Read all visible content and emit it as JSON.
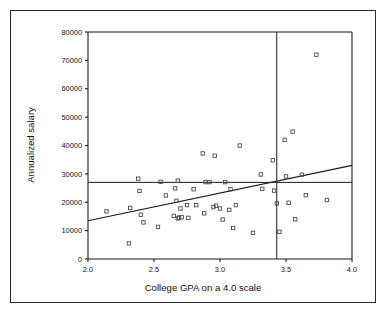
{
  "figure": {
    "border_color": "#2b2b2b",
    "background": "#ffffff",
    "ink_color": "#1a1a1a",
    "marker_color": "#4a4a4a"
  },
  "labels": {
    "x_axis_title": "College GPA on a 4.0 scale",
    "y_axis_title": "Annualized salary",
    "x_ticks": [
      "2.0",
      "2.5",
      "3.0",
      "3.5",
      "4.0"
    ],
    "y_ticks": [
      "0",
      "10000",
      "20000",
      "30000",
      "40000",
      "50000",
      "60000",
      "70000",
      "80000"
    ]
  },
  "chart_data": {
    "type": "scatter",
    "title": "",
    "xlabel": "College GPA on a 4.0 scale",
    "ylabel": "Annualized salary",
    "xlim": [
      2.0,
      4.0
    ],
    "ylim": [
      0,
      80000
    ],
    "xticks": [
      2.0,
      2.5,
      3.0,
      3.5,
      4.0
    ],
    "yticks": [
      0,
      10000,
      20000,
      30000,
      40000,
      50000,
      60000,
      70000,
      80000
    ],
    "grid": false,
    "legend": "none",
    "marker": "open-square",
    "points": [
      [
        2.14,
        16800
      ],
      [
        2.31,
        5500
      ],
      [
        2.32,
        18000
      ],
      [
        2.38,
        28300
      ],
      [
        2.39,
        24000
      ],
      [
        2.4,
        15600
      ],
      [
        2.42,
        12900
      ],
      [
        2.53,
        11300
      ],
      [
        2.55,
        27200
      ],
      [
        2.59,
        22400
      ],
      [
        2.65,
        15200
      ],
      [
        2.66,
        24900
      ],
      [
        2.67,
        20500
      ],
      [
        2.68,
        27600
      ],
      [
        2.68,
        14300
      ],
      [
        2.69,
        14600
      ],
      [
        2.7,
        17800
      ],
      [
        2.71,
        14700
      ],
      [
        2.75,
        19000
      ],
      [
        2.76,
        14500
      ],
      [
        2.8,
        24600
      ],
      [
        2.82,
        19000
      ],
      [
        2.87,
        37200
      ],
      [
        2.88,
        16100
      ],
      [
        2.89,
        27100
      ],
      [
        2.92,
        27100
      ],
      [
        2.95,
        18300
      ],
      [
        2.96,
        36400
      ],
      [
        2.97,
        18800
      ],
      [
        3.0,
        17800
      ],
      [
        3.02,
        13900
      ],
      [
        3.04,
        27100
      ],
      [
        3.07,
        17300
      ],
      [
        3.08,
        24600
      ],
      [
        3.1,
        10900
      ],
      [
        3.12,
        19000
      ],
      [
        3.15,
        40000
      ],
      [
        3.25,
        9200
      ],
      [
        3.31,
        29800
      ],
      [
        3.32,
        24700
      ],
      [
        3.4,
        34800
      ],
      [
        3.41,
        24100
      ],
      [
        3.43,
        19600
      ],
      [
        3.45,
        9600
      ],
      [
        3.49,
        42000
      ],
      [
        3.5,
        29100
      ],
      [
        3.52,
        19800
      ],
      [
        3.55,
        44900
      ],
      [
        3.57,
        14000
      ],
      [
        3.62,
        29700
      ],
      [
        3.65,
        22500
      ],
      [
        3.73,
        72000
      ],
      [
        3.81,
        20800
      ]
    ],
    "reference_lines": [
      {
        "orientation": "horizontal",
        "value": 27000,
        "name": "mean-salary-line"
      },
      {
        "orientation": "vertical",
        "value": 3.43,
        "name": "gpa-cutoff-line"
      }
    ],
    "fit_line": {
      "name": "regression-line",
      "x_start": 2.0,
      "y_start": 13500,
      "x_end": 4.0,
      "y_end": 33000
    }
  }
}
